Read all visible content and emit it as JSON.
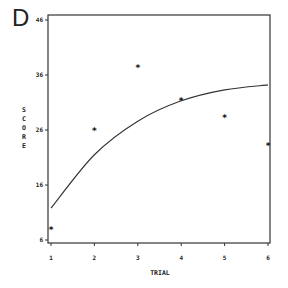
{
  "panel": {
    "letter": "D"
  },
  "chart_data": {
    "type": "scatter",
    "title": "",
    "xlabel": "TRIAL",
    "ylabel": "SCORE",
    "xlim": [
      1,
      6
    ],
    "ylim": [
      6,
      46
    ],
    "x_ticks": [
      1,
      2,
      3,
      4,
      5,
      6
    ],
    "y_ticks": [
      6,
      16,
      26,
      36,
      46
    ],
    "grid": false,
    "legend": null,
    "series": [
      {
        "name": "observed",
        "kind": "scatter",
        "marker": "*",
        "x": [
          1,
          2,
          3,
          4,
          5,
          6
        ],
        "y": [
          8,
          26,
          37.3,
          31.3,
          28.3,
          23.2
        ]
      },
      {
        "name": "fitted curve",
        "kind": "line",
        "x": [
          1,
          2,
          3,
          4,
          5,
          6
        ],
        "y": [
          11.8,
          21.5,
          27.6,
          31.3,
          33.3,
          34.2
        ]
      }
    ]
  }
}
